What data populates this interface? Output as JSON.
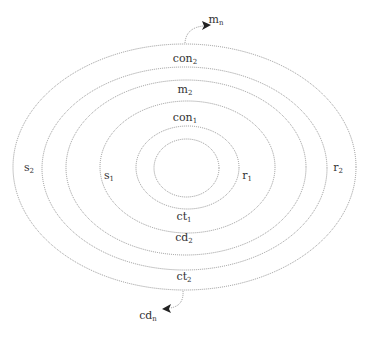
{
  "diagram": {
    "type": "concentric-ellipses",
    "colors": {
      "ring_stroke": "#8a8a8a",
      "text": "#333333",
      "arrowhead": "#222222"
    },
    "rings": [
      {
        "id": "ring-6",
        "cx": 184.5,
        "cy": 167,
        "rx": 171.5,
        "ry": 123
      },
      {
        "id": "ring-5",
        "cx": 184.5,
        "cy": 168.5,
        "rx": 142.5,
        "ry": 101.5
      },
      {
        "id": "ring-4",
        "cx": 186,
        "cy": 167.5,
        "rx": 120,
        "ry": 87.5
      },
      {
        "id": "ring-3",
        "cx": 187.5,
        "cy": 167,
        "rx": 87.5,
        "ry": 66
      },
      {
        "id": "ring-2",
        "cx": 187.5,
        "cy": 167.5,
        "rx": 51.5,
        "ry": 41.5
      },
      {
        "id": "ring-1",
        "cx": 186.5,
        "cy": 168,
        "rx": 32.5,
        "ry": 29
      }
    ],
    "labels": {
      "m_n": {
        "base": "m",
        "sub": "n",
        "x": 216,
        "y": 20
      },
      "con_2": {
        "base": "con",
        "sub": "2",
        "x": 185,
        "y": 59
      },
      "m_2": {
        "base": "m",
        "sub": "2",
        "x": 185,
        "y": 90
      },
      "con_1": {
        "base": "con",
        "sub": "1",
        "x": 185,
        "y": 118
      },
      "s_2": {
        "base": "s",
        "sub": "2",
        "x": 29,
        "y": 168
      },
      "s_1": {
        "base": "s",
        "sub": "1",
        "x": 109,
        "y": 176
      },
      "r_1": {
        "base": "r",
        "sub": "1",
        "x": 247,
        "y": 176
      },
      "r_2": {
        "base": "r",
        "sub": "2",
        "x": 338,
        "y": 168
      },
      "ct_1": {
        "base": "ct",
        "sub": "1",
        "x": 184,
        "y": 217
      },
      "cd_2": {
        "base": "cd",
        "sub": "2",
        "x": 184,
        "y": 238
      },
      "ct_2": {
        "base": "ct",
        "sub": "2",
        "x": 184,
        "y": 277
      },
      "cd_n": {
        "base": "cd",
        "sub": "n",
        "x": 148,
        "y": 316
      }
    },
    "arrows": [
      {
        "id": "arrow-to-m_n",
        "from": [
          185,
          43
        ],
        "to": [
          210,
          25
        ]
      },
      {
        "id": "arrow-to-cd_n",
        "from": [
          183,
          291
        ],
        "to": [
          163,
          309
        ]
      }
    ]
  }
}
